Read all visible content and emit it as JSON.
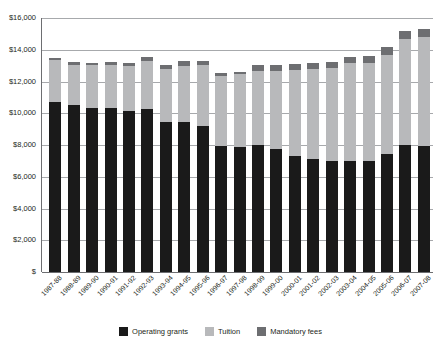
{
  "chart_data": {
    "type": "bar",
    "subtype": "stacked-bar",
    "title": "",
    "xlabel": "",
    "ylabel": "",
    "ylim": [
      0,
      16000
    ],
    "ytick_step": 2000,
    "ytick_labels": [
      "$16,000",
      "$14,000",
      "$12,000",
      "$10,000",
      "$8,000",
      "$6,000",
      "$4,000",
      "$2,000",
      "$"
    ],
    "ytick_values": [
      16000,
      14000,
      12000,
      10000,
      8000,
      6000,
      4000,
      2000,
      0
    ],
    "grid": true,
    "grid_axis": "y",
    "legend_position": "bottom",
    "categories": [
      "1987-88",
      "1988-89",
      "1989-90",
      "1990-91",
      "1991-92",
      "1992-93",
      "1993-94",
      "1994-95",
      "1995-96",
      "1996-97",
      "1997-98",
      "1998-99",
      "1999-00",
      "2000-01",
      "2001-02",
      "2002-03",
      "2003-04",
      "2004-05",
      "2005-06",
      "2006-07",
      "2007-08"
    ],
    "series": [
      {
        "name": "Operating grants",
        "color": "#1a1a1a",
        "values": [
          10700,
          10500,
          10350,
          10330,
          10150,
          10240,
          9450,
          9480,
          9180,
          7950,
          7880,
          7980,
          7750,
          7280,
          7150,
          7000,
          7020,
          6980,
          7450,
          7980,
          7930
        ]
      },
      {
        "name": "Tuition",
        "color": "#b8b9bb",
        "values": [
          2680,
          2530,
          2660,
          2710,
          2800,
          3030,
          3320,
          3520,
          3870,
          4420,
          4580,
          4690,
          4900,
          5420,
          5630,
          5830,
          6150,
          6190,
          6220,
          6700,
          6870
        ]
      },
      {
        "name": "Mandatory fees",
        "color": "#6d6e71",
        "values": [
          130,
          170,
          170,
          210,
          190,
          250,
          240,
          270,
          270,
          150,
          160,
          370,
          420,
          420,
          400,
          400,
          400,
          430,
          480,
          520,
          510
        ]
      }
    ],
    "totals": [
      13510,
      13200,
      13180,
      13250,
      13140,
      13520,
      13010,
      13270,
      13320,
      12520,
      12620,
      13040,
      13070,
      13120,
      13180,
      13230,
      13570,
      13600,
      14150,
      15200,
      15310
    ]
  },
  "legend": {
    "items": [
      {
        "label": "Operating grants",
        "color": "#1a1a1a"
      },
      {
        "label": "Tuition",
        "color": "#b8b9bb"
      },
      {
        "label": "Mandatory fees",
        "color": "#6d6e71"
      }
    ]
  }
}
